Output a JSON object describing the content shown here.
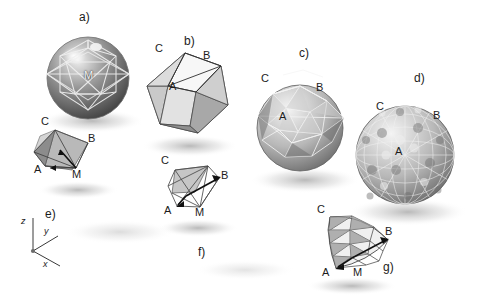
{
  "figure": {
    "kind": "geodesic-sphere-subdivision-diagram",
    "background_color": "#ffffff",
    "ink_color": "#1c1c1c",
    "panels": [
      {
        "id": "a",
        "label": "a)",
        "label_pos": [
          85,
          18
        ],
        "caption_role": "circumscribed-sphere-with-inscribed-icosahedron",
        "center": [
          88,
          78
        ],
        "radius": 41,
        "vertex_labels": [
          {
            "text": "M",
            "pos": [
              89,
              76
            ],
            "style": "inner"
          }
        ]
      },
      {
        "id": "b",
        "label": "b)",
        "label_pos": [
          190,
          42
        ],
        "caption_role": "icosahedron-base-solid",
        "center": [
          185,
          95
        ],
        "radius": 42,
        "vertex_labels": [
          {
            "text": "C",
            "pos": [
              160,
              50
            ]
          },
          {
            "text": "B",
            "pos": [
              208,
              57
            ]
          },
          {
            "text": "A",
            "pos": [
              174,
              87
            ]
          }
        ]
      },
      {
        "id": "c",
        "label": "c)",
        "label_pos": [
          305,
          54
        ],
        "caption_role": "once-subdivided-geodesic-sphere",
        "center": [
          300,
          128
        ],
        "radius": 43,
        "vertex_labels": [
          {
            "text": "C",
            "pos": [
              266,
              80
            ]
          },
          {
            "text": "B",
            "pos": [
              321,
              89
            ]
          },
          {
            "text": "A",
            "pos": [
              284,
              118
            ]
          }
        ]
      },
      {
        "id": "d",
        "label": "d)",
        "label_pos": [
          420,
          79
        ],
        "caption_role": "finely-subdivided-geodesic-sphere",
        "center": [
          405,
          155
        ],
        "radius": 49,
        "vertex_labels": [
          {
            "text": "C",
            "pos": [
              381,
              108
            ]
          },
          {
            "text": "B",
            "pos": [
              438,
              117
            ]
          },
          {
            "text": "A",
            "pos": [
              400,
              153
            ]
          }
        ]
      },
      {
        "id": "a-wedge",
        "label": "",
        "caption_role": "base-spherical-wedge-under-a",
        "vertex_labels": [
          {
            "text": "C",
            "pos": [
              46,
              123
            ]
          },
          {
            "text": "B",
            "pos": [
              93,
              140
            ]
          },
          {
            "text": "A",
            "pos": [
              39,
              171
            ]
          },
          {
            "text": "M",
            "pos": [
              77,
              176
            ]
          }
        ]
      },
      {
        "id": "f",
        "label": "f)",
        "label_pos": [
          203,
          253
        ],
        "caption_role": "wireframe-wedge-single-facet",
        "vertex_labels": [
          {
            "text": "C",
            "pos": [
              166,
              162
            ]
          },
          {
            "text": "B",
            "pos": [
              226,
              177
            ]
          },
          {
            "text": "A",
            "pos": [
              169,
              212
            ]
          },
          {
            "text": "M",
            "pos": [
              200,
              214
            ]
          }
        ]
      },
      {
        "id": "g",
        "label": "g)",
        "label_pos": [
          389,
          268
        ],
        "caption_role": "subdivided-spherical-triangle-patch",
        "vertex_labels": [
          {
            "text": "C",
            "pos": [
              322,
              211
            ]
          },
          {
            "text": "B",
            "pos": [
              390,
              233
            ]
          },
          {
            "text": "A",
            "pos": [
              327,
              274
            ]
          },
          {
            "text": "M",
            "pos": [
              358,
              274
            ]
          }
        ]
      },
      {
        "id": "e",
        "label": "e)",
        "label_pos": [
          50,
          215
        ],
        "caption_role": "coordinate-axis-indicator"
      }
    ],
    "axes": {
      "origin": [
        33,
        251
      ],
      "ticks": [
        {
          "name": "z",
          "label": "z",
          "label_pos": [
            24,
            222
          ],
          "end": [
            33,
            218
          ]
        },
        {
          "name": "y",
          "label": "y",
          "label_pos": [
            47,
            232
          ],
          "end": [
            57,
            236
          ]
        },
        {
          "name": "x",
          "label": "x",
          "label_pos": [
            46,
            265
          ],
          "end": [
            58,
            265
          ]
        }
      ]
    },
    "vertex_label_set": [
      "A",
      "B",
      "C",
      "M"
    ],
    "panel_label_set": [
      "a)",
      "b)",
      "c)",
      "d)",
      "e)",
      "f)",
      "g)"
    ]
  }
}
